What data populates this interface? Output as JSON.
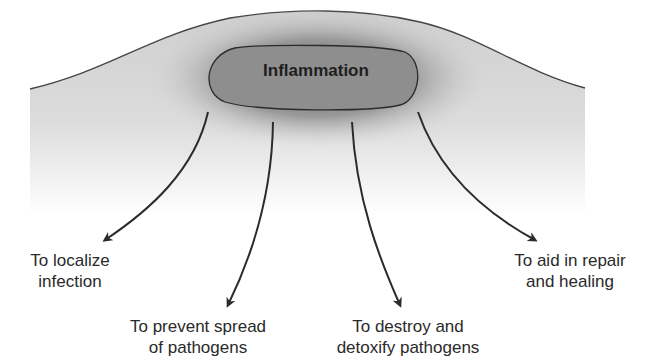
{
  "diagram": {
    "center": {
      "label": "Inflammation"
    },
    "outcomes": [
      {
        "line1": "To localize",
        "line2": "infection"
      },
      {
        "line1": "To prevent spread",
        "line2": "of pathogens"
      },
      {
        "line1": "To destroy and",
        "line2": "detoxify pathogens"
      },
      {
        "line1": "To aid in repair",
        "line2": "and healing"
      }
    ],
    "colors": {
      "tissue": "#d0d0d0",
      "core": "#8c8c8c",
      "stroke": "#2b2b2b",
      "text": "#2a2a2a"
    }
  }
}
